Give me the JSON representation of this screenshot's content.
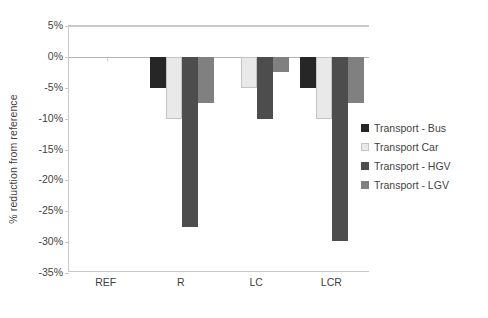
{
  "chart_data": {
    "type": "bar",
    "title": "",
    "subtitle": "",
    "xlabel": "",
    "ylabel": "% reduction from reference",
    "categories": [
      "REF",
      "R",
      "LC",
      "LCR"
    ],
    "series": [
      {
        "name": "Transport - Bus",
        "color": "#262626",
        "border": "#262626",
        "values": [
          0,
          -5.0,
          0,
          -5.0
        ]
      },
      {
        "name": "Transport  Car",
        "color": "#e9e9e9",
        "border": "#c4c4c4",
        "values": [
          0,
          -10.0,
          -5.0,
          -10.0
        ]
      },
      {
        "name": "Transport - HGV",
        "color": "#4d4d4d",
        "border": "#4d4d4d",
        "values": [
          0,
          -27.6,
          -10.0,
          -29.8
        ]
      },
      {
        "name": "Transport - LGV",
        "color": "#808080",
        "border": "#808080",
        "values": [
          0,
          -7.5,
          -2.4,
          -7.5
        ]
      }
    ],
    "ylim": [
      -35,
      5
    ],
    "yticks": [
      5,
      0,
      -5,
      -10,
      -15,
      -20,
      -25,
      -30,
      -35
    ],
    "ytick_labels": [
      "5%",
      "0%",
      "-5%",
      "-10%",
      "-15%",
      "-20%",
      "-25%",
      "-30%",
      "-35%"
    ],
    "grid": "horizontal-at-ticks-top-and-zero",
    "legend_position": "right",
    "zero_reference": 0
  },
  "axis": {
    "y_title": "% reduction from reference"
  },
  "legend": {
    "items": [
      {
        "label": "Transport - Bus"
      },
      {
        "label": "Transport  Car"
      },
      {
        "label": "Transport - HGV"
      },
      {
        "label": "Transport - LGV"
      }
    ]
  },
  "colors": {
    "bus": "#262626",
    "car": "#e9e9e9",
    "car_border": "#c4c4c4",
    "hgv": "#4d4d4d",
    "lgv": "#808080",
    "axis": "#c9c9c9",
    "text": "#3f3f3f",
    "background": "#ffffff"
  }
}
